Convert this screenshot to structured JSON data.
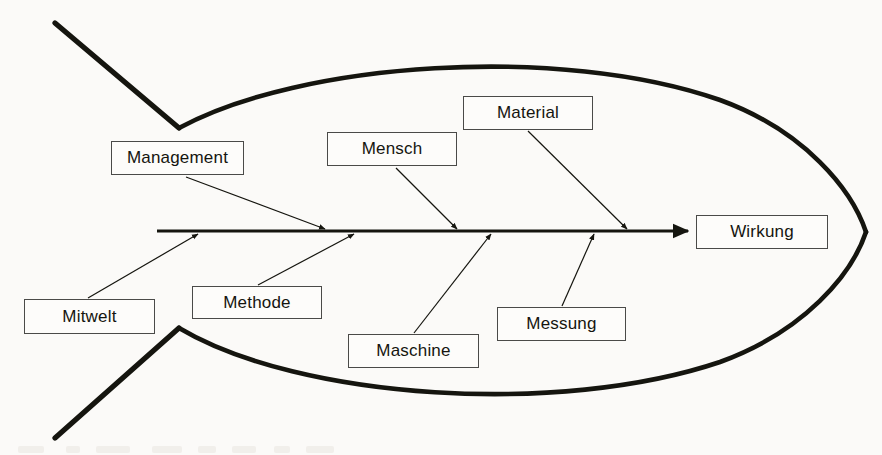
{
  "document": {
    "title": "Ishikawa-Diagramm (Ursache-Wirkungs-Diagramm)",
    "language": "de",
    "background_color": "#fbfaf8",
    "ink_color": "#15150f"
  },
  "chart_data": {
    "type": "diagram",
    "diagram_type": "fishbone",
    "effect": "Wirkung",
    "categories": [
      "Management",
      "Mensch",
      "Material",
      "Mitwelt",
      "Methode",
      "Maschine",
      "Messung"
    ],
    "above_spine": [
      "Management",
      "Mensch",
      "Material"
    ],
    "below_spine": [
      "Mitwelt",
      "Methode",
      "Maschine",
      "Messung"
    ],
    "spine_direction": "left-to-right",
    "arrow_count": 7
  },
  "boxes": [
    {
      "id": "management",
      "label": "Management",
      "x": 111,
      "y": 141,
      "w": 133,
      "h": 34,
      "side": "above"
    },
    {
      "id": "mensch",
      "label": "Mensch",
      "x": 327,
      "y": 132,
      "w": 130,
      "h": 34,
      "side": "above"
    },
    {
      "id": "material",
      "label": "Material",
      "x": 463,
      "y": 96,
      "w": 130,
      "h": 34,
      "side": "above"
    },
    {
      "id": "mitwelt",
      "label": "Mitwelt",
      "x": 24,
      "y": 299,
      "w": 131,
      "h": 35,
      "side": "below"
    },
    {
      "id": "methode",
      "label": "Methode",
      "x": 192,
      "y": 286,
      "w": 130,
      "h": 33,
      "side": "below"
    },
    {
      "id": "maschine",
      "label": "Maschine",
      "x": 348,
      "y": 334,
      "w": 131,
      "h": 34,
      "side": "below"
    },
    {
      "id": "messung",
      "label": "Messung",
      "x": 497,
      "y": 307,
      "w": 129,
      "h": 34,
      "side": "below"
    },
    {
      "id": "wirkung",
      "label": "Wirkung",
      "x": 696,
      "y": 215,
      "w": 132,
      "h": 34,
      "side": "effect"
    }
  ],
  "spine": {
    "x_start": 157,
    "x_end": 690,
    "y": 231
  },
  "bones": [
    {
      "from": "management",
      "x1": 186,
      "y1": 176,
      "x2": 323,
      "y2": 228
    },
    {
      "from": "mensch",
      "x1": 396,
      "y1": 167,
      "x2": 455,
      "y2": 228
    },
    {
      "from": "material",
      "x1": 528,
      "y1": 131,
      "x2": 625,
      "y2": 228
    },
    {
      "from": "mitwelt",
      "x1": 90,
      "y1": 298,
      "x2": 199,
      "y2": 236
    },
    {
      "from": "methode",
      "x1": 259,
      "y1": 285,
      "x2": 355,
      "y2": 236
    },
    {
      "from": "maschine",
      "x1": 414,
      "y1": 333,
      "x2": 492,
      "y2": 236
    },
    {
      "from": "messung",
      "x1": 562,
      "y1": 306,
      "x2": 595,
      "y2": 236
    }
  ]
}
